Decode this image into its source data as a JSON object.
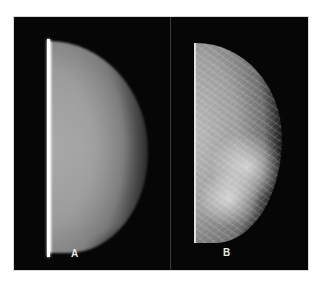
{
  "figure": {
    "panels": [
      {
        "id": "a",
        "label": "A",
        "description": "mammogram, low-contrast smooth gray"
      },
      {
        "id": "b",
        "label": "B",
        "description": "mammogram, high-contrast textured"
      }
    ],
    "colors": {
      "background": "#ffffff",
      "frame": "#050505",
      "divider": "#3a3a3a",
      "label": "#e6e6e6"
    }
  }
}
